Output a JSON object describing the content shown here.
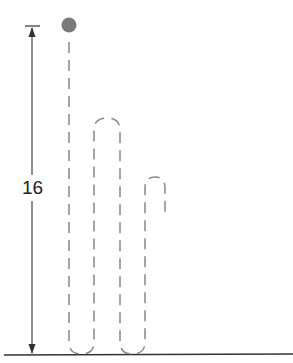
{
  "diagram": {
    "height_label": "16",
    "ball_color": "#7a7a7a",
    "line_color": "#333333",
    "dash_color": "#888888"
  }
}
